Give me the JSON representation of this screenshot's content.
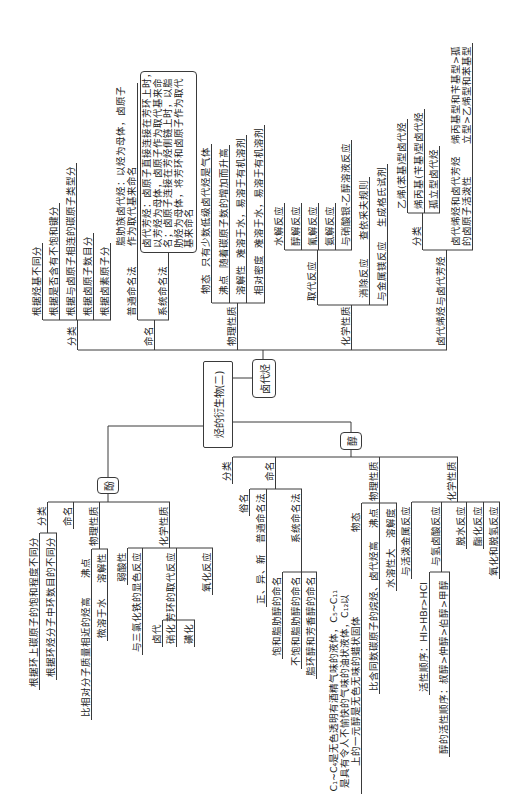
{
  "root": {
    "label": "烃的衍生物(二)"
  },
  "haloalkane": {
    "label": "卤代烃",
    "classification": {
      "label": "分类",
      "items": [
        "根据烃基不同分",
        "根据是否含有不饱和键分",
        "根据与卤原子相连的碳原子类型分",
        "根据卤原子数目分",
        "根据卤素原子分"
      ]
    },
    "naming": {
      "label": "命名",
      "common": {
        "label": "普通命名法",
        "detail_lines": [
          "脂肪族卤代烃：以烃为母体，卤原子",
          "作为取代基来命名"
        ]
      },
      "systematic": {
        "label": "系统命名法",
        "detail_lines": [
          "卤代芳烃：卤原子直接连接在芳环上时，",
          "以芳烃为母体，卤原子作为取代基来命",
          "名；卤原子连接在芳烃侧链上时，以脂",
          "肪烃为母体，将芳环和卤原子作为取代",
          "基来命名"
        ]
      }
    },
    "physical": {
      "label": "物理性质",
      "items": [
        {
          "label": "物态",
          "detail": "只有少数低级卤代烃是气体"
        },
        {
          "label": "沸点",
          "detail": "随着碳原子数的增加而升高"
        },
        {
          "label": "溶解性",
          "detail": "难溶于水，易溶于有机溶剂"
        },
        {
          "label": "相对密度",
          "detail": "难溶于水，易溶于有机溶剂"
        }
      ]
    },
    "chemical": {
      "label": "化学性质",
      "substitution": {
        "label": "取代反应",
        "items": [
          "水解反应",
          "醇解反应",
          "氰解反应",
          "氨解反应",
          "与硝酸银-乙醇溶液反应"
        ]
      },
      "elimination": {
        "label": "消除反应",
        "detail": "查依采夫规则"
      },
      "magnesium": {
        "label": "与金属镁反应",
        "detail": "生成格氏试剂"
      }
    },
    "unsaturated": {
      "label": "卤代烯烃与卤代芳烃",
      "classification": {
        "label": "分类",
        "items": [
          "乙烯(苯基)型卤代烃",
          "烯丙基(苄基)型卤代烃",
          "孤立型卤代烃"
        ]
      },
      "reactivity": {
        "label_lines": [
          "卤代烯烃和卤代芳烃",
          "的卤原子活泼性"
        ],
        "detail_lines": [
          "烯丙基型和苄基型>孤",
          "立型>乙烯型和苯基型"
        ]
      }
    }
  },
  "alcohol": {
    "label": "醇",
    "classification": {
      "label": "分类"
    },
    "naming": {
      "label": "命名",
      "trivial": {
        "label": "俗名"
      },
      "common": {
        "label": "普通命名法",
        "detail": "正、异、新"
      },
      "systematic": {
        "label": "系统命名法",
        "items": [
          "饱和脂肪醇的命名",
          "不饱和脂肪醇的命名",
          "脂环醇和芳香醇的命名"
        ]
      }
    },
    "physical": {
      "label": "物理性质",
      "state": {
        "label": "物态",
        "detail_lines": [
          "C₁~C₄是无色透明有酒精气味的液体，C₅~C₁₁",
          "是具有令人不愉快的气味的油状液体，C₁₂以",
          "上的一元醇是无色无味的蜡状固体"
        ]
      },
      "boiling": {
        "label": "沸点",
        "detail": "比含同数碳原子的烷烃、卤代烃高"
      },
      "solubility": {
        "label": "溶解度",
        "detail": "水溶性大"
      }
    },
    "chemical": {
      "label": "化学性质",
      "active_metal": "与活泼金属反应",
      "hydrohalic": {
        "label": "与氢卤酸反应",
        "items": [
          "活性顺序：HI>HBr>HCl",
          "醇的活性顺序：叔醇>仲醇>伯醇>甲醇"
        ]
      },
      "dehydration": "脱水反应",
      "esterification": "酯化反应",
      "oxidation": "氧化和脱氢反应"
    }
  },
  "phenol": {
    "label": "酚",
    "classification": {
      "label": "分类",
      "items": [
        "根据环上碳原子的饱和程度不同分",
        "根据环烃分子中环数目的不同分"
      ]
    },
    "naming": {
      "label": "命名"
    },
    "physical": {
      "label": "物理性质",
      "boiling": {
        "label": "沸点",
        "detail": "比相对分子质量相近的烃高"
      },
      "solubility": {
        "label": "溶解性",
        "detail": "微溶于水"
      }
    },
    "chemical": {
      "label": "化学性质",
      "acidity": "弱酸性",
      "fecl3": "与三氯化铁的显色反应",
      "substitution": {
        "label": "芳环的取代反应",
        "items": [
          "卤代",
          "硝化",
          "磺化"
        ]
      },
      "oxidation": "氧化反应"
    }
  }
}
